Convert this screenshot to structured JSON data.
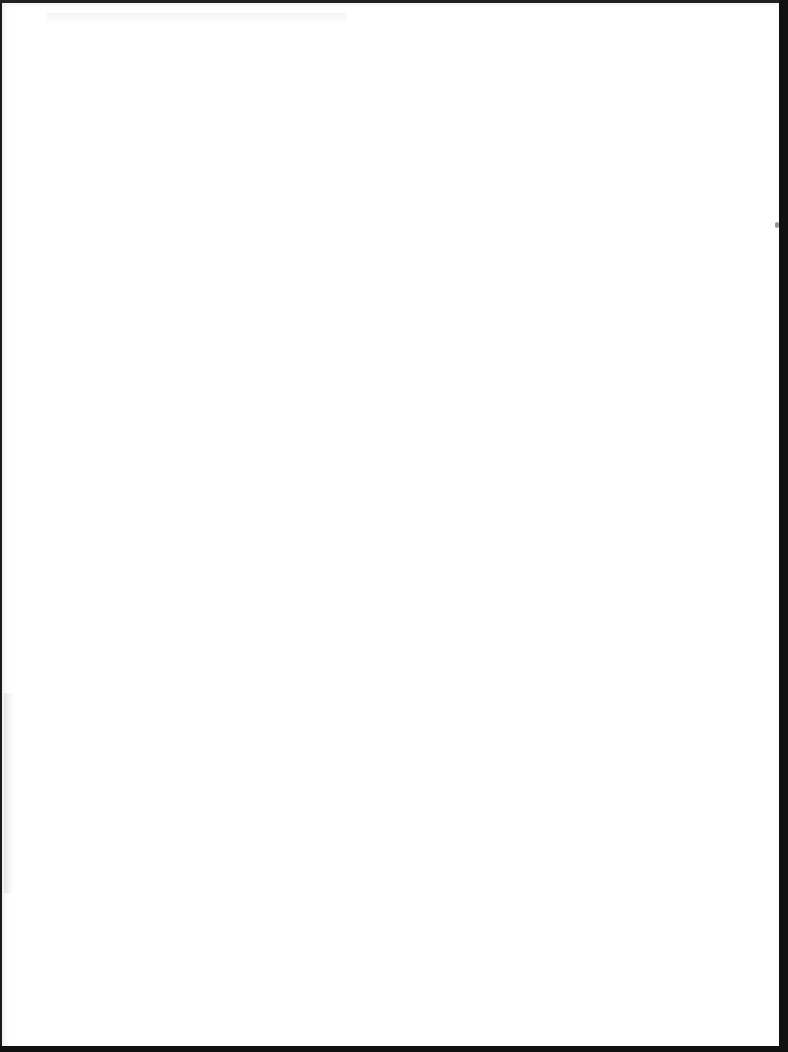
{
  "document": {
    "type": "blank-scanned-page",
    "content": ""
  }
}
